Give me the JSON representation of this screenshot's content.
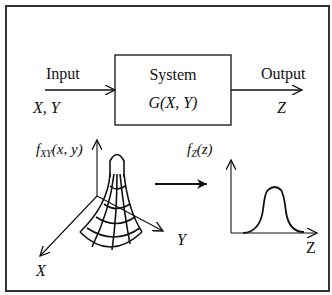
{
  "diagram": {
    "input": {
      "label": "Input",
      "variables": "X, Y"
    },
    "system": {
      "label": "System",
      "function": "G(X, Y)"
    },
    "output": {
      "label": "Output",
      "variable": "Z"
    },
    "joint_pdf": {
      "label_f": "f",
      "label_sub": "XY",
      "label_args": "(x, y)",
      "axis_x": "X",
      "axis_y": "Y"
    },
    "output_pdf": {
      "label_f": "f",
      "label_sub": "Z",
      "label_args": "(z)",
      "axis_z": "Z"
    },
    "colors": {
      "stroke": "#111111",
      "border": "#333333",
      "background": "#ffffff"
    }
  }
}
